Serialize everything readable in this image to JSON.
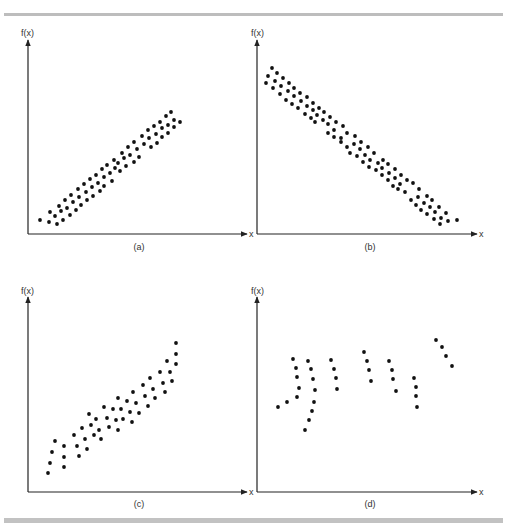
{
  "figure": {
    "panels": [
      {
        "id": "a",
        "caption": "(a)",
        "ylabel": "f(x)",
        "xlabel": "x",
        "origin": [
          28,
          234
        ],
        "y_top": 40,
        "x_end": 247,
        "caption_pos": [
          139,
          250
        ],
        "ylabel_pos": [
          21,
          36
        ],
        "xlabel_pos": [
          249,
          237
        ],
        "description": "strong positive linear relationship"
      },
      {
        "id": "b",
        "caption": "(b)",
        "ylabel": "f(x)",
        "xlabel": "x",
        "origin": [
          257,
          234
        ],
        "y_top": 40,
        "x_end": 477,
        "caption_pos": [
          370,
          250
        ],
        "ylabel_pos": [
          251,
          36
        ],
        "xlabel_pos": [
          479,
          237
        ],
        "description": "strong negative linear relationship"
      },
      {
        "id": "c",
        "caption": "(c)",
        "ylabel": "f(x)",
        "xlabel": "x",
        "origin": [
          28,
          492
        ],
        "y_top": 297,
        "x_end": 247,
        "caption_pos": [
          139,
          507
        ],
        "ylabel_pos": [
          21,
          294
        ],
        "xlabel_pos": [
          249,
          495
        ],
        "description": "positive curvilinear relationship"
      },
      {
        "id": "d",
        "caption": "(d)",
        "ylabel": "f(x)",
        "xlabel": "x",
        "origin": [
          257,
          492
        ],
        "y_top": 297,
        "x_end": 477,
        "caption_pos": [
          370,
          507
        ],
        "ylabel_pos": [
          251,
          294
        ],
        "xlabel_pos": [
          479,
          495
        ],
        "description": "no clear relationship (clustered)"
      }
    ]
  },
  "colors": {
    "axis": "#222222",
    "dot": "#111111",
    "text": "#333333",
    "rule": "#bdbdbd"
  },
  "chart_data": [
    {
      "type": "scatter",
      "title": "(a)",
      "xlabel": "x",
      "ylabel": "f(x)",
      "grid": false,
      "pixel_points": [
        [
          40,
          220
        ],
        [
          49,
          222
        ],
        [
          50,
          212
        ],
        [
          55,
          216
        ],
        [
          57,
          224
        ],
        [
          59,
          206
        ],
        [
          61,
          211
        ],
        [
          63,
          220
        ],
        [
          65,
          200
        ],
        [
          67,
          208
        ],
        [
          70,
          215
        ],
        [
          71,
          195
        ],
        [
          73,
          202
        ],
        [
          76,
          210
        ],
        [
          78,
          189
        ],
        [
          79,
          197
        ],
        [
          81,
          205
        ],
        [
          84,
          184
        ],
        [
          86,
          192
        ],
        [
          87,
          200
        ],
        [
          90,
          179
        ],
        [
          92,
          187
        ],
        [
          93,
          196
        ],
        [
          96,
          175
        ],
        [
          98,
          183
        ],
        [
          100,
          191
        ],
        [
          102,
          169
        ],
        [
          104,
          177
        ],
        [
          104,
          186
        ],
        [
          107,
          165
        ],
        [
          110,
          173
        ],
        [
          112,
          181
        ],
        [
          114,
          160
        ],
        [
          115,
          168
        ],
        [
          118,
          163
        ],
        [
          120,
          171
        ],
        [
          122,
          153
        ],
        [
          124,
          158
        ],
        [
          126,
          166
        ],
        [
          128,
          147
        ],
        [
          130,
          155
        ],
        [
          134,
          142
        ],
        [
          134,
          162
        ],
        [
          137,
          149
        ],
        [
          139,
          157
        ],
        [
          142,
          136
        ],
        [
          144,
          144
        ],
        [
          148,
          130
        ],
        [
          149,
          138
        ],
        [
          151,
          147
        ],
        [
          154,
          126
        ],
        [
          156,
          134
        ],
        [
          157,
          143
        ],
        [
          160,
          122
        ],
        [
          162,
          128
        ],
        [
          162,
          137
        ],
        [
          166,
          116
        ],
        [
          168,
          125
        ],
        [
          168,
          133
        ],
        [
          171,
          112
        ],
        [
          174,
          120
        ],
        [
          174,
          127
        ],
        [
          180,
          122
        ]
      ]
    },
    {
      "type": "scatter",
      "title": "(b)",
      "xlabel": "x",
      "ylabel": "f(x)",
      "grid": false,
      "pixel_points": [
        [
          272,
          68
        ],
        [
          268,
          76
        ],
        [
          277,
          73
        ],
        [
          266,
          83
        ],
        [
          275,
          81
        ],
        [
          283,
          78
        ],
        [
          273,
          88
        ],
        [
          281,
          86
        ],
        [
          289,
          83
        ],
        [
          280,
          94
        ],
        [
          288,
          91
        ],
        [
          294,
          88
        ],
        [
          286,
          100
        ],
        [
          294,
          96
        ],
        [
          300,
          93
        ],
        [
          292,
          104
        ],
        [
          301,
          101
        ],
        [
          307,
          97
        ],
        [
          298,
          108
        ],
        [
          307,
          106
        ],
        [
          313,
          103
        ],
        [
          305,
          114
        ],
        [
          313,
          110
        ],
        [
          319,
          108
        ],
        [
          311,
          118
        ],
        [
          317,
          115
        ],
        [
          324,
          112
        ],
        [
          315,
          122
        ],
        [
          323,
          120
        ],
        [
          330,
          117
        ],
        [
          328,
          133
        ],
        [
          328,
          124
        ],
        [
          336,
          122
        ],
        [
          334,
          130
        ],
        [
          343,
          126
        ],
        [
          334,
          137
        ],
        [
          341,
          138
        ],
        [
          347,
          133
        ],
        [
          355,
          136
        ],
        [
          341,
          142
        ],
        [
          347,
          147
        ],
        [
          354,
          144
        ],
        [
          361,
          142
        ],
        [
          350,
          153
        ],
        [
          360,
          149
        ],
        [
          368,
          147
        ],
        [
          357,
          156
        ],
        [
          365,
          155
        ],
        [
          374,
          153
        ],
        [
          363,
          162
        ],
        [
          370,
          160
        ],
        [
          378,
          163
        ],
        [
          383,
          160
        ],
        [
          369,
          167
        ],
        [
          376,
          170
        ],
        [
          382,
          168
        ],
        [
          388,
          164
        ],
        [
          382,
          175
        ],
        [
          389,
          173
        ],
        [
          395,
          169
        ],
        [
          388,
          180
        ],
        [
          395,
          178
        ],
        [
          401,
          175
        ],
        [
          393,
          186
        ],
        [
          400,
          184
        ],
        [
          407,
          180
        ],
        [
          398,
          189
        ],
        [
          405,
          192
        ],
        [
          413,
          183
        ],
        [
          411,
          200
        ],
        [
          418,
          197
        ],
        [
          419,
          189
        ],
        [
          416,
          205
        ],
        [
          424,
          203
        ],
        [
          427,
          196
        ],
        [
          421,
          210
        ],
        [
          430,
          207
        ],
        [
          432,
          200
        ],
        [
          427,
          214
        ],
        [
          435,
          212
        ],
        [
          439,
          207
        ],
        [
          434,
          219
        ],
        [
          441,
          218
        ],
        [
          446,
          213
        ],
        [
          440,
          224
        ],
        [
          448,
          221
        ],
        [
          457,
          220
        ]
      ]
    },
    {
      "type": "scatter",
      "title": "(c)",
      "xlabel": "x",
      "ylabel": "f(x)",
      "grid": false,
      "pixel_points": [
        [
          48,
          473
        ],
        [
          50,
          463
        ],
        [
          52,
          452
        ],
        [
          55,
          441
        ],
        [
          64,
          446
        ],
        [
          64,
          457
        ],
        [
          64,
          467
        ],
        [
          74,
          435
        ],
        [
          77,
          446
        ],
        [
          79,
          456
        ],
        [
          82,
          428
        ],
        [
          85,
          439
        ],
        [
          87,
          449
        ],
        [
          89,
          414
        ],
        [
          91,
          425
        ],
        [
          94,
          435
        ],
        [
          96,
          419
        ],
        [
          99,
          430
        ],
        [
          101,
          439
        ],
        [
          104,
          407
        ],
        [
          107,
          418
        ],
        [
          109,
          427
        ],
        [
          113,
          409
        ],
        [
          116,
          420
        ],
        [
          118,
          398
        ],
        [
          118,
          430
        ],
        [
          121,
          409
        ],
        [
          123,
          419
        ],
        [
          127,
          401
        ],
        [
          130,
          412
        ],
        [
          132,
          422
        ],
        [
          133,
          392
        ],
        [
          136,
          403
        ],
        [
          139,
          413
        ],
        [
          143,
          385
        ],
        [
          145,
          396
        ],
        [
          148,
          406
        ],
        [
          150,
          378
        ],
        [
          153,
          389
        ],
        [
          155,
          398
        ],
        [
          160,
          372
        ],
        [
          163,
          383
        ],
        [
          165,
          392
        ],
        [
          167,
          361
        ],
        [
          170,
          372
        ],
        [
          172,
          381
        ],
        [
          176,
          343
        ],
        [
          176,
          354
        ],
        [
          176,
          364
        ]
      ]
    },
    {
      "type": "scatter",
      "title": "(d)",
      "xlabel": "x",
      "ylabel": "f(x)",
      "grid": false,
      "pixel_points": [
        [
          278,
          407
        ],
        [
          287,
          402
        ],
        [
          293,
          359
        ],
        [
          296,
          368
        ],
        [
          297,
          377
        ],
        [
          299,
          388
        ],
        [
          297,
          397
        ],
        [
          308,
          361
        ],
        [
          311,
          369
        ],
        [
          313,
          379
        ],
        [
          315,
          390
        ],
        [
          314,
          402
        ],
        [
          312,
          411
        ],
        [
          309,
          420
        ],
        [
          305,
          430
        ],
        [
          331,
          360
        ],
        [
          334,
          369
        ],
        [
          336,
          378
        ],
        [
          337,
          389
        ],
        [
          364,
          352
        ],
        [
          367,
          361
        ],
        [
          369,
          370
        ],
        [
          371,
          381
        ],
        [
          389,
          361
        ],
        [
          392,
          370
        ],
        [
          393,
          379
        ],
        [
          396,
          391
        ],
        [
          414,
          378
        ],
        [
          416,
          387
        ],
        [
          416,
          396
        ],
        [
          417,
          407
        ],
        [
          436,
          340
        ],
        [
          442,
          347
        ],
        [
          446,
          356
        ],
        [
          452,
          366
        ]
      ]
    }
  ]
}
